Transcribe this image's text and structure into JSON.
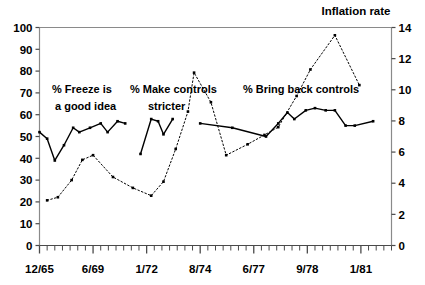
{
  "chart_data": {
    "type": "line",
    "title": "Inflation rate",
    "xlabel": "",
    "ylabel_left": "",
    "ylabel_right": "Inflation rate",
    "grid": false,
    "legend": "none",
    "ylim_left": [
      0,
      100
    ],
    "ylim_right": [
      0,
      14
    ],
    "yticks_left": [
      "0",
      "10",
      "20",
      "30",
      "40",
      "50",
      "60",
      "70",
      "80",
      "90",
      "100"
    ],
    "yticks_right": [
      "0",
      "2",
      "4",
      "6",
      "8",
      "10",
      "12",
      "14"
    ],
    "xticks_major": [
      "12/65",
      "6/69",
      "1/72",
      "8/74",
      "6/77",
      "9/78",
      "1/81"
    ],
    "x_major_index": [
      0,
      7,
      14,
      21,
      28,
      35,
      42
    ],
    "n_minor_ticks": 46,
    "annotations": [
      {
        "id": "freeze",
        "line1": "% Freeze is",
        "line2": "a good idea"
      },
      {
        "id": "stricter",
        "line1": "% Make controls",
        "line2": "stricter"
      },
      {
        "id": "bringback",
        "line1": "% Bring back controls",
        "line2": ""
      }
    ],
    "series": [
      {
        "name": "survey-percent",
        "style": "solid",
        "axis": "left",
        "segments": [
          {
            "label": "% Freeze is a good idea",
            "points": [
              {
                "x": 0.0,
                "y": 52
              },
              {
                "x": 1.0,
                "y": 49
              },
              {
                "x": 2.0,
                "y": 39
              },
              {
                "x": 3.2,
                "y": 46
              },
              {
                "x": 4.4,
                "y": 54
              },
              {
                "x": 5.2,
                "y": 52
              },
              {
                "x": 6.6,
                "y": 54
              },
              {
                "x": 8.0,
                "y": 56
              },
              {
                "x": 8.9,
                "y": 52
              },
              {
                "x": 10.2,
                "y": 57
              },
              {
                "x": 11.2,
                "y": 56
              }
            ]
          },
          {
            "label": "% Make controls stricter",
            "points": [
              {
                "x": 13.2,
                "y": 42
              },
              {
                "x": 14.6,
                "y": 58
              },
              {
                "x": 15.5,
                "y": 57
              },
              {
                "x": 16.2,
                "y": 51
              },
              {
                "x": 17.4,
                "y": 58
              }
            ]
          },
          {
            "label": "% Bring back controls",
            "points": [
              {
                "x": 21.0,
                "y": 56
              },
              {
                "x": 25.2,
                "y": 54
              },
              {
                "x": 29.6,
                "y": 50
              },
              {
                "x": 31.2,
                "y": 56
              },
              {
                "x": 32.4,
                "y": 61
              },
              {
                "x": 33.3,
                "y": 58
              },
              {
                "x": 34.8,
                "y": 62
              },
              {
                "x": 36.0,
                "y": 63
              },
              {
                "x": 37.4,
                "y": 62
              },
              {
                "x": 38.6,
                "y": 62
              },
              {
                "x": 40.0,
                "y": 55
              },
              {
                "x": 41.2,
                "y": 55
              },
              {
                "x": 43.6,
                "y": 57
              }
            ]
          }
        ]
      },
      {
        "name": "inflation-rate",
        "style": "dotted",
        "axis": "right",
        "segments": [
          {
            "label": "Inflation rate",
            "points": [
              {
                "x": 1.0,
                "y": 2.9
              },
              {
                "x": 2.4,
                "y": 3.1
              },
              {
                "x": 4.2,
                "y": 4.2
              },
              {
                "x": 5.6,
                "y": 5.5
              },
              {
                "x": 7.0,
                "y": 5.8
              },
              {
                "x": 9.6,
                "y": 4.4
              },
              {
                "x": 12.2,
                "y": 3.7
              },
              {
                "x": 14.6,
                "y": 3.2
              },
              {
                "x": 16.2,
                "y": 4.1
              },
              {
                "x": 17.8,
                "y": 6.2
              },
              {
                "x": 19.4,
                "y": 8.6
              },
              {
                "x": 20.2,
                "y": 11.1
              },
              {
                "x": 22.4,
                "y": 9.2
              },
              {
                "x": 24.4,
                "y": 5.8
              },
              {
                "x": 27.2,
                "y": 6.5
              },
              {
                "x": 29.4,
                "y": 7.1
              },
              {
                "x": 31.2,
                "y": 7.6
              },
              {
                "x": 33.6,
                "y": 9.6
              },
              {
                "x": 35.4,
                "y": 11.3
              },
              {
                "x": 38.6,
                "y": 13.5
              },
              {
                "x": 41.8,
                "y": 10.3
              }
            ]
          }
        ]
      }
    ]
  }
}
